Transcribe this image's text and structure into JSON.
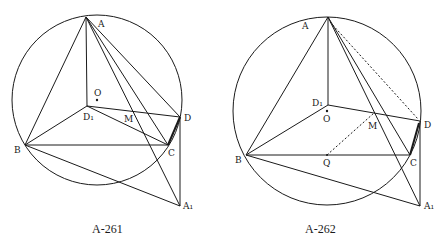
{
  "figures": [
    {
      "caption": "A-261",
      "labels": {
        "A": "A",
        "O": "O",
        "D1": "D₁",
        "M": "M",
        "D": "D",
        "B": "B",
        "C": "C",
        "A1": "A₁"
      }
    },
    {
      "caption": "A-262",
      "labels": {
        "A": "A",
        "O": "O",
        "D1": "D₁",
        "M": "M",
        "D": "D",
        "B": "B",
        "C": "C",
        "Q": "Q",
        "A1": "A₁"
      }
    }
  ]
}
